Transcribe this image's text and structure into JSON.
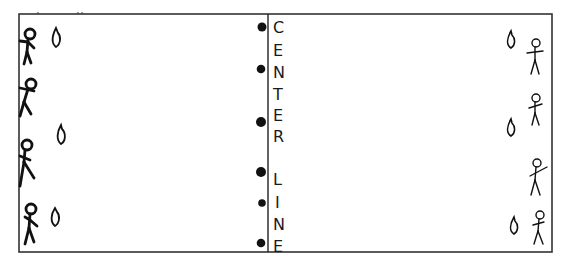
{
  "diagram": {
    "field": {
      "x": 19,
      "y": 14,
      "width": 533,
      "height": 238,
      "stroke": "#333333"
    },
    "center_line": {
      "x": 268,
      "label_letters": [
        "C",
        "E",
        "N",
        "T",
        "E",
        "R",
        "L",
        "I",
        "N",
        "E"
      ],
      "label": "CENTER LINE"
    },
    "markers": [
      {
        "type": "dot",
        "x": 262,
        "y": 27
      },
      {
        "type": "dot",
        "x": 261,
        "y": 69
      },
      {
        "type": "dot",
        "x": 261,
        "y": 122
      },
      {
        "type": "dot",
        "x": 261,
        "y": 172
      },
      {
        "type": "dot",
        "x": 262,
        "y": 203
      },
      {
        "type": "dot",
        "x": 261,
        "y": 243
      }
    ],
    "left_team": {
      "players": [
        {
          "x": 30,
          "y": 32
        },
        {
          "x": 30,
          "y": 85
        },
        {
          "x": 26,
          "y": 146
        },
        {
          "x": 31,
          "y": 209
        }
      ],
      "cones": [
        {
          "x": 57,
          "y": 36
        },
        {
          "x": 62,
          "y": 131
        },
        {
          "x": 55,
          "y": 214
        }
      ]
    },
    "right_team": {
      "players": [
        {
          "x": 535,
          "y": 47
        },
        {
          "x": 537,
          "y": 102
        },
        {
          "x": 538,
          "y": 164
        },
        {
          "x": 540,
          "y": 218
        }
      ],
      "cones": [
        {
          "x": 511,
          "y": 39
        },
        {
          "x": 512,
          "y": 127
        },
        {
          "x": 514,
          "y": 227
        }
      ]
    }
  }
}
